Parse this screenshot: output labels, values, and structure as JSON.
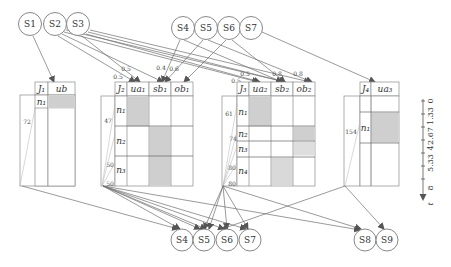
{
  "top_nodes": [
    {
      "id": "S1",
      "label": "S1",
      "x": 30,
      "y": 24
    },
    {
      "id": "S2",
      "label": "S2",
      "x": 55,
      "y": 24
    },
    {
      "id": "S3",
      "label": "S3",
      "x": 78,
      "y": 24
    },
    {
      "id": "S4",
      "label": "S4",
      "x": 183,
      "y": 28
    },
    {
      "id": "S5",
      "label": "S5",
      "x": 206,
      "y": 28
    },
    {
      "id": "S6",
      "label": "S6",
      "x": 229,
      "y": 28
    },
    {
      "id": "S7",
      "label": "S7",
      "x": 251,
      "y": 28
    }
  ],
  "bottom_nodes": [
    {
      "id": "S4b",
      "label": "S4",
      "x": 182,
      "y": 240
    },
    {
      "id": "S5b",
      "label": "S5",
      "x": 204,
      "y": 240
    },
    {
      "id": "S6b",
      "label": "S6",
      "x": 227,
      "y": 240
    },
    {
      "id": "S7b",
      "label": "S7",
      "x": 250,
      "y": 240
    },
    {
      "id": "S8",
      "label": "S8",
      "x": 365,
      "y": 240
    },
    {
      "id": "S9",
      "label": "S9",
      "x": 387,
      "y": 240
    }
  ],
  "tables": [
    {
      "id": "J1",
      "header": [
        "J1",
        "ub"
      ],
      "rows": [
        "n1"
      ],
      "side_labels": [
        "72"
      ]
    },
    {
      "id": "J2",
      "header": [
        "J2",
        "ua1",
        "sb1",
        "ob1"
      ],
      "rows": [
        "n1",
        "n2",
        "n3"
      ],
      "side_labels": [
        "47",
        "50",
        "50"
      ]
    },
    {
      "id": "J3",
      "header": [
        "J3",
        "ua2",
        "sb2",
        "ob2"
      ],
      "rows": [
        "n1",
        "n2",
        "n3",
        "n4"
      ],
      "side_labels": [
        "61",
        "74",
        "80",
        "80"
      ]
    },
    {
      "id": "J4",
      "header": [
        "J4",
        "ua3"
      ],
      "rows": [
        "n1"
      ],
      "side_labels": [
        "154"
      ]
    }
  ],
  "edge_weights": [
    "0.5",
    "0.5",
    "0.4",
    "0.6",
    "0.5",
    "0.5",
    "0.8",
    "0.8"
  ],
  "time_axis": {
    "label": "t",
    "ticks": [
      "0",
      "1.33",
      "2.67",
      "4",
      "5.33",
      "8"
    ]
  }
}
